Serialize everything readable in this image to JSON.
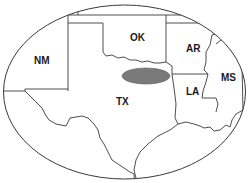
{
  "map": {
    "frame_shape": "ellipse",
    "states": [
      {
        "id": "nm",
        "label": "NM"
      },
      {
        "id": "ok",
        "label": "OK"
      },
      {
        "id": "ar",
        "label": "AR"
      },
      {
        "id": "tx",
        "label": "TX"
      },
      {
        "id": "la",
        "label": "LA"
      },
      {
        "id": "ms",
        "label": "MS"
      }
    ],
    "highlight": {
      "shape": "ellipse",
      "color": "#7a7a7a",
      "location": "TX-OK border"
    },
    "colors": {
      "background": "#ffffff",
      "border": "#3a3a3a",
      "label": "#1a1a1a",
      "highlight": "#7a7a7a"
    }
  }
}
